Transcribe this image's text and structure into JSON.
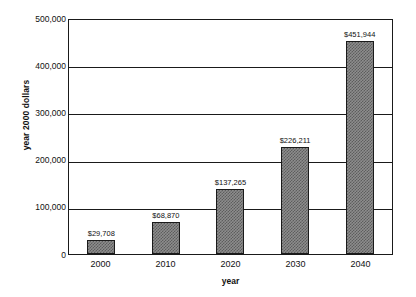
{
  "chart_data": {
    "type": "bar",
    "title": "",
    "categories": [
      "2000",
      "2010",
      "2020",
      "2030",
      "2040"
    ],
    "values": [
      29708,
      68870,
      137265,
      226211,
      451944
    ],
    "value_labels": [
      "$29,708",
      "$68,870",
      "$137,265",
      "$226,211",
      "$451,944"
    ],
    "xlabel": "year",
    "ylabel": "year 2000 dollars",
    "ylim": [
      0,
      500000
    ],
    "ytick_values": [
      0,
      100000,
      200000,
      300000,
      400000,
      500000
    ],
    "ytick_labels": [
      "0",
      "100,000",
      "200,000",
      "300,000",
      "400,000",
      "500,000"
    ],
    "grid": "horizontal",
    "legend": "none",
    "bar_fill_color": "#8d8d8d",
    "bar_edge_color": "#1a1a1a",
    "axis_color": "#1a1a1a",
    "background_color": "#ffffff"
  }
}
